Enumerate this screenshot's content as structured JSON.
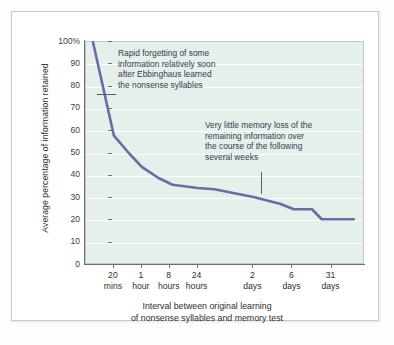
{
  "chart_data": {
    "type": "line",
    "title": "",
    "subtitle": "",
    "xlabel": "Interval between original learning of nonsense syllables and memory test",
    "xlabel_lines": [
      "Interval between original learning",
      "of nonsense syllables and memory test"
    ],
    "ylabel": "Average percentage of information retained",
    "ylim": [
      0,
      100
    ],
    "xlim": [
      0,
      10
    ],
    "grid": true,
    "legend": "none",
    "y_ticks": [
      0,
      10,
      20,
      30,
      40,
      50,
      60,
      70,
      80,
      90,
      100
    ],
    "y_tick_labels": [
      "0",
      "10",
      "20",
      "30",
      "40",
      "50",
      "60",
      "70",
      "80",
      "90",
      "100%"
    ],
    "x_categories": [
      {
        "num": "20",
        "unit": "mins",
        "x": 1
      },
      {
        "num": "1",
        "unit": "hour",
        "x": 2
      },
      {
        "num": "8",
        "unit": "hours",
        "x": 3
      },
      {
        "num": "24",
        "unit": "hours",
        "x": 4
      },
      {
        "num": "2",
        "unit": "days",
        "x": 6
      },
      {
        "num": "6",
        "unit": "days",
        "x": 7.4
      },
      {
        "num": "31",
        "unit": "days",
        "x": 8.8
      }
    ],
    "series": [
      {
        "name": "Average percentage of information retained",
        "color": "#6b6ba4",
        "points": [
          {
            "x": 0.25,
            "y": 100
          },
          {
            "x": 1.0,
            "y": 58
          },
          {
            "x": 1.55,
            "y": 50
          },
          {
            "x": 2.0,
            "y": 44
          },
          {
            "x": 2.6,
            "y": 39
          },
          {
            "x": 3.1,
            "y": 36
          },
          {
            "x": 4.0,
            "y": 34.5
          },
          {
            "x": 4.6,
            "y": 34
          },
          {
            "x": 6.0,
            "y": 30.5
          },
          {
            "x": 6.95,
            "y": 27.5
          },
          {
            "x": 7.45,
            "y": 25
          },
          {
            "x": 8.1,
            "y": 25
          },
          {
            "x": 8.45,
            "y": 20.5
          },
          {
            "x": 9.6,
            "y": 20.5
          }
        ]
      }
    ],
    "annotations": [
      {
        "id": "annotation-1",
        "lines": [
          "Rapid forgetting of some",
          "information relatively soon",
          "after Ebbinghaus learned",
          "the nonsense syllables"
        ],
        "leader": "horizontal"
      },
      {
        "id": "annotation-2",
        "lines": [
          "Very little memory loss of the",
          "remaining information over",
          "the course of the following",
          "several weeks"
        ],
        "leader": "vertical"
      }
    ],
    "colors": {
      "line": "#6b6ba4",
      "plot_background": "#e4f0e9",
      "gridline": "#ffffff",
      "axis": "#6f6f6f",
      "text": "#2e2e2e",
      "annotation_text": "#3a3a52",
      "card_background": "#ffffff",
      "page_background": "#fdfdfd"
    }
  }
}
